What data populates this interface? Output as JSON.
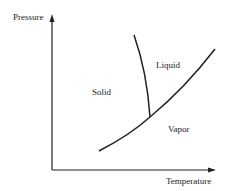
{
  "diagram": {
    "axes": {
      "y_label": "Pressure",
      "x_label": "Temperature"
    },
    "regions": {
      "solid": "Solid",
      "liquid": "Liquid",
      "vapor": "Vapor"
    },
    "curves": [
      {
        "name": "sublimation-vaporization-curve",
        "description": "Solid/Vapor and Liquid/Vapor boundary"
      },
      {
        "name": "fusion-curve",
        "description": "Solid/Liquid boundary"
      }
    ],
    "colors": {
      "line": "#222222",
      "background": "#ffffff"
    }
  }
}
